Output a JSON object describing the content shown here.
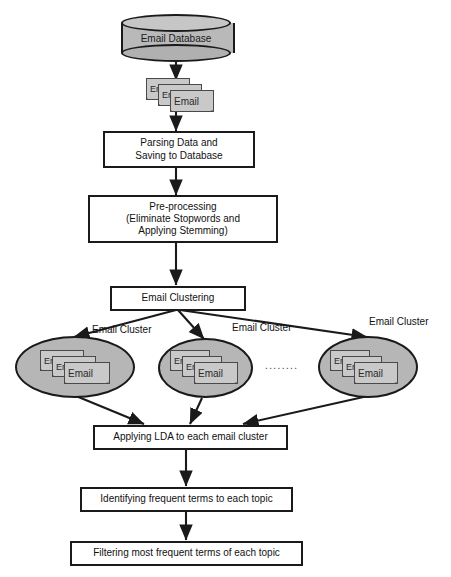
{
  "diagram": {
    "colors": {
      "node_fill": "#ffffff",
      "node_stroke": "#1a1a1a",
      "cluster_fill": "#b6b6b6",
      "database_fill": "#b9b9b9",
      "email_icon_fill": "#c9c9c9",
      "edge_stroke": "#1a1a1a",
      "text": "#111111"
    },
    "nodes": {
      "database": {
        "label": "Email Database",
        "shape": "cylinder"
      },
      "email_stack_top": {
        "label": "Email",
        "shape": "document-stack",
        "count": 3
      },
      "parsing": {
        "line1": "Parsing Data and",
        "line2": "Saving to Database",
        "shape": "rectangle"
      },
      "preprocessing": {
        "line1": "Pre-processing",
        "line2": "(Eliminate Stopwords and",
        "line3": "Applying Stemming)",
        "shape": "rectangle"
      },
      "clustering": {
        "label": "Email Clustering",
        "shape": "rectangle"
      },
      "lda": {
        "label": "Applying LDA to each email cluster",
        "shape": "rectangle"
      },
      "identifying": {
        "label": "Identifying frequent terms to each topic",
        "shape": "rectangle"
      },
      "filtering": {
        "label": "Filtering most frequent terms of each topic",
        "shape": "rectangle"
      }
    },
    "clusters": [
      {
        "label": "Email Cluster",
        "email_label": "Email",
        "shape": "ellipse"
      },
      {
        "label": "Email Cluster",
        "email_label": "Email",
        "shape": "ellipse"
      },
      {
        "label": "Email Cluster",
        "email_label": "Email",
        "shape": "ellipse"
      }
    ],
    "ellipsis": "........"
  }
}
